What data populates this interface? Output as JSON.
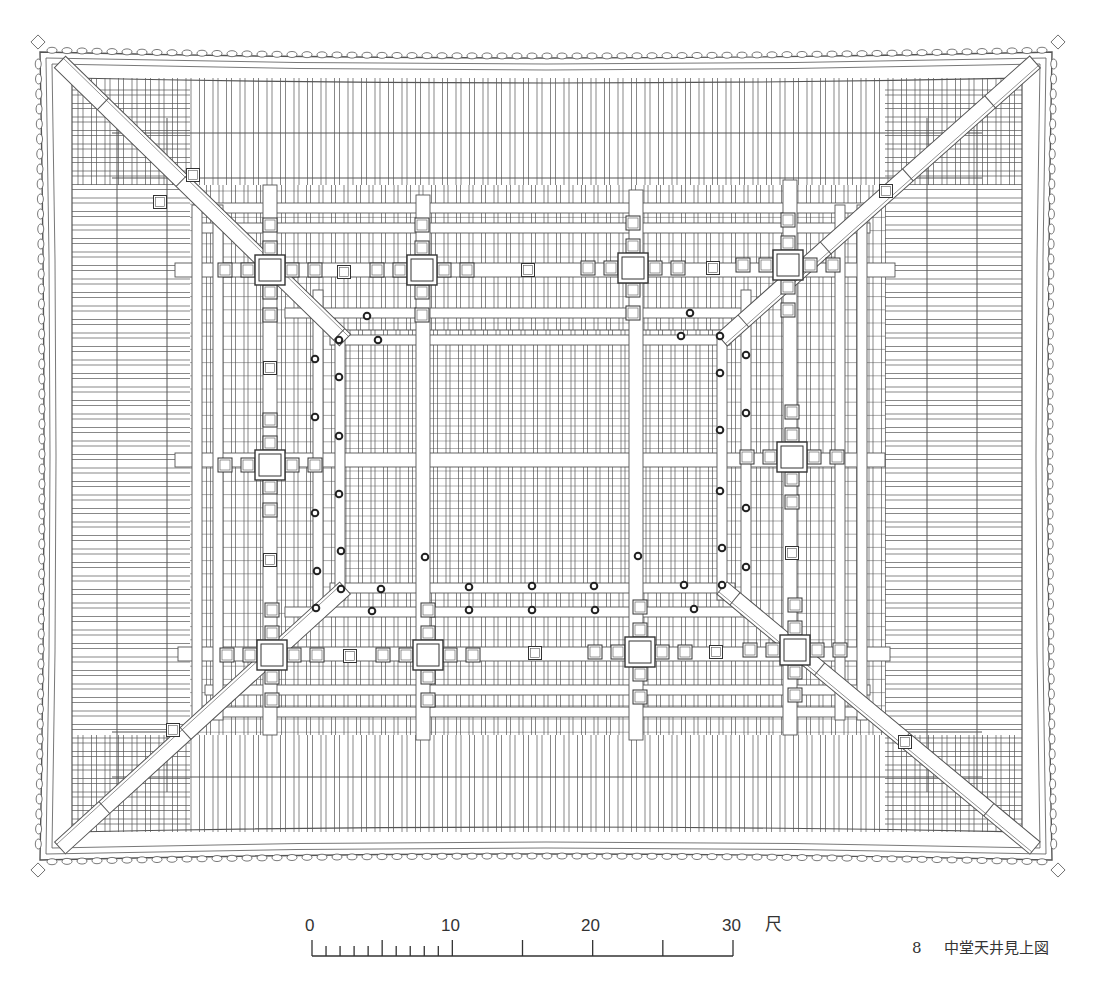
{
  "figure": {
    "caption_number": "8",
    "caption_title": "中堂天井見上図",
    "line_color": "#555555",
    "dark_color": "#333333",
    "background": "#ffffff"
  },
  "scale_bar": {
    "unit": "尺",
    "labels": [
      {
        "text": "0",
        "value": 0
      },
      {
        "text": "10",
        "value": 10
      },
      {
        "text": "20",
        "value": 20
      },
      {
        "text": "30",
        "value": 30
      }
    ],
    "x0": 312,
    "x30": 733,
    "baseline_y": 956,
    "minor_tick_top": 946,
    "major_tick_top": 940,
    "minor_ticks_per_unit": 1,
    "major_every": 5,
    "max": 30
  },
  "plan": {
    "outer": {
      "left": 40,
      "top": 52,
      "right": 1052,
      "bottom": 860
    },
    "rafter_field": {
      "left": 72,
      "top": 78,
      "right": 1022,
      "bottom": 832
    },
    "inner_grid": {
      "left": 180,
      "top": 175,
      "right": 895,
      "bottom": 745
    },
    "center_panel": {
      "left": 340,
      "top": 330,
      "right": 722,
      "bottom": 588
    },
    "columns": [
      {
        "x": 270,
        "y": 270
      },
      {
        "x": 422,
        "y": 270
      },
      {
        "x": 633,
        "y": 268
      },
      {
        "x": 788,
        "y": 265
      },
      {
        "x": 270,
        "y": 465
      },
      {
        "x": 792,
        "y": 457
      },
      {
        "x": 272,
        "y": 655
      },
      {
        "x": 428,
        "y": 655
      },
      {
        "x": 640,
        "y": 652
      },
      {
        "x": 795,
        "y": 650
      }
    ],
    "small_blocks": [
      {
        "x": 344,
        "y": 272
      },
      {
        "x": 528,
        "y": 270
      },
      {
        "x": 713,
        "y": 268
      },
      {
        "x": 270,
        "y": 368
      },
      {
        "x": 792,
        "y": 553
      },
      {
        "x": 270,
        "y": 560
      },
      {
        "x": 350,
        "y": 656
      },
      {
        "x": 535,
        "y": 653
      },
      {
        "x": 716,
        "y": 652
      },
      {
        "x": 193,
        "y": 175
      },
      {
        "x": 886,
        "y": 191
      },
      {
        "x": 160,
        "y": 202
      },
      {
        "x": 173,
        "y": 730
      },
      {
        "x": 905,
        "y": 742
      }
    ],
    "dots": [
      {
        "x": 367,
        "y": 316
      },
      {
        "x": 690,
        "y": 313
      },
      {
        "x": 339,
        "y": 340
      },
      {
        "x": 378,
        "y": 340
      },
      {
        "x": 681,
        "y": 336
      },
      {
        "x": 720,
        "y": 336
      },
      {
        "x": 315,
        "y": 359
      },
      {
        "x": 746,
        "y": 355
      },
      {
        "x": 339,
        "y": 377
      },
      {
        "x": 720,
        "y": 373
      },
      {
        "x": 315,
        "y": 417
      },
      {
        "x": 746,
        "y": 413
      },
      {
        "x": 339,
        "y": 436
      },
      {
        "x": 720,
        "y": 430
      },
      {
        "x": 339,
        "y": 494
      },
      {
        "x": 720,
        "y": 491
      },
      {
        "x": 315,
        "y": 513
      },
      {
        "x": 746,
        "y": 508
      },
      {
        "x": 341,
        "y": 551
      },
      {
        "x": 425,
        "y": 557
      },
      {
        "x": 638,
        "y": 556
      },
      {
        "x": 722,
        "y": 548
      },
      {
        "x": 317,
        "y": 571
      },
      {
        "x": 746,
        "y": 567
      },
      {
        "x": 341,
        "y": 589
      },
      {
        "x": 381,
        "y": 589
      },
      {
        "x": 469,
        "y": 587
      },
      {
        "x": 532,
        "y": 586
      },
      {
        "x": 594,
        "y": 586
      },
      {
        "x": 684,
        "y": 585
      },
      {
        "x": 722,
        "y": 585
      },
      {
        "x": 316,
        "y": 608
      },
      {
        "x": 372,
        "y": 611
      },
      {
        "x": 469,
        "y": 610
      },
      {
        "x": 532,
        "y": 610
      },
      {
        "x": 595,
        "y": 610
      },
      {
        "x": 694,
        "y": 609
      }
    ]
  }
}
